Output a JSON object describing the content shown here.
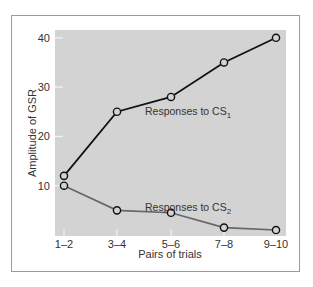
{
  "chart_data": {
    "type": "line",
    "title": "",
    "xlabel": "Pairs of trials",
    "ylabel": "Amplitude of GSR",
    "categories": [
      "1–2",
      "3–4",
      "5–6",
      "7–8",
      "9–10"
    ],
    "yticks": [
      10,
      20,
      30,
      40
    ],
    "ylim": [
      0,
      42
    ],
    "grid": false,
    "legend": "inline labels",
    "series": [
      {
        "name": "Responses to CS1",
        "label_main": "Responses to CS",
        "label_sub": "1",
        "color": "#111111",
        "values": [
          12,
          25,
          28,
          35,
          40
        ]
      },
      {
        "name": "Responses to CS2",
        "label_main": "Responses to CS",
        "label_sub": "2",
        "color": "#666666",
        "values": [
          10,
          5,
          4.5,
          1.5,
          1
        ]
      }
    ]
  },
  "colors": {
    "plot_background": "#d3d3d3",
    "frame": "#9a9a9a"
  }
}
